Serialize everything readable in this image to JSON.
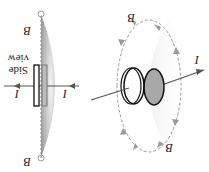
{
  "diagram": {
    "orientation_deg": 180,
    "labels": {
      "current": "I",
      "field": "B",
      "side_view_line1": "Side",
      "side_view_line2": "view"
    },
    "colors": {
      "wire": "#555555",
      "plate_outline": "#111111",
      "plate_fill": "#a8a8a8",
      "field_line": "#888888",
      "field_arrow": "#9a9a9a",
      "shading": "#d0d0d0"
    }
  }
}
